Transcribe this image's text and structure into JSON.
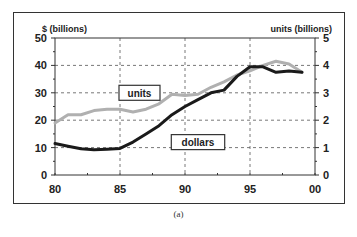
{
  "caption": "(a)",
  "chart_data": {
    "type": "line",
    "title": "",
    "xlabel": "",
    "ylabel": "$ (billions)",
    "y2label": "units (billions)",
    "xlim": [
      80,
      100
    ],
    "ylim": [
      0,
      50
    ],
    "y2lim": [
      0,
      5
    ],
    "x_tick_labels": [
      "80",
      "85",
      "90",
      "95",
      "00"
    ],
    "y_tick_labels": [
      "0",
      "10",
      "20",
      "30",
      "40",
      "50"
    ],
    "y2_tick_labels": [
      "0",
      "1",
      "2",
      "3",
      "4",
      "5"
    ],
    "grid": true,
    "x": [
      80,
      81,
      82,
      83,
      84,
      85,
      86,
      87,
      88,
      89,
      90,
      91,
      92,
      93,
      94,
      95,
      96,
      97,
      98,
      99
    ],
    "series": [
      {
        "name": "dollars",
        "axis": "left",
        "color": "#1a1a1a",
        "values": [
          11.5,
          10.5,
          9.6,
          9.2,
          9.4,
          9.7,
          12.0,
          15.0,
          18.0,
          22.0,
          25.0,
          27.5,
          30.0,
          31.0,
          36.0,
          39.5,
          39.5,
          37.5,
          38.0,
          37.5
        ]
      },
      {
        "name": "units",
        "axis": "right",
        "color": "#b0b0b0",
        "values": [
          1.9,
          2.2,
          2.2,
          2.35,
          2.4,
          2.4,
          2.3,
          2.4,
          2.6,
          2.95,
          2.9,
          2.95,
          3.2,
          3.4,
          3.65,
          3.8,
          4.0,
          4.15,
          4.05,
          3.75
        ]
      }
    ],
    "annotations": [
      {
        "text": "units",
        "x": 86.5,
        "y": 30
      },
      {
        "text": "dollars",
        "x": 91,
        "y": 12
      }
    ]
  }
}
